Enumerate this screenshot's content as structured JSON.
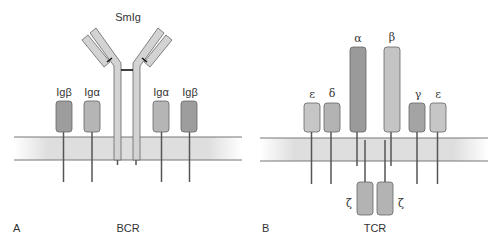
{
  "panels": [
    {
      "id": "A",
      "letter": "A",
      "title": "BCR",
      "antibody_label": "SmIg",
      "chains": [
        {
          "label": "Igβ",
          "shade": "dark"
        },
        {
          "label": "Igα",
          "shade": "medium"
        },
        {
          "label": "Igα",
          "shade": "medium"
        },
        {
          "label": "Igβ",
          "shade": "dark"
        }
      ]
    },
    {
      "id": "B",
      "letter": "B",
      "title": "TCR",
      "chains": [
        {
          "label": "ε",
          "shade": "light"
        },
        {
          "label": "δ",
          "shade": "medium"
        },
        {
          "label": "α",
          "shade": "dark"
        },
        {
          "label": "β",
          "shade": "light"
        },
        {
          "label": "γ",
          "shade": "dark"
        },
        {
          "label": "ε",
          "shade": "light"
        }
      ],
      "zeta_chains": [
        {
          "label": "ζ"
        },
        {
          "label": "ζ"
        }
      ]
    }
  ],
  "colors": {
    "dark": "#9a9a9a",
    "medium": "#b3b3b3",
    "light": "#c8c8c8",
    "smig": "#d2d2d2",
    "outline": "#666666",
    "membrane_line": "#777777",
    "membrane_fill": "#dcdcdc"
  }
}
